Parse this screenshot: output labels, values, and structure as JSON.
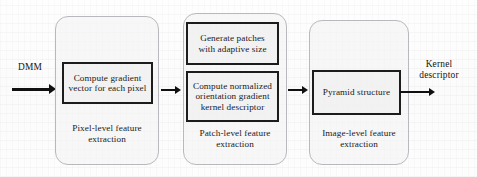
{
  "figure": {
    "type": "flow-diagram",
    "orientation": "left-to-right",
    "background_note": "scanned paper with faint bleed-through texture"
  },
  "input": {
    "label": "DMM"
  },
  "output": {
    "label_line1": "Kernel",
    "label_line2": "descriptor"
  },
  "stages": [
    {
      "id": "pixel-level",
      "caption_line1": "Pixel-level feature",
      "caption_line2": "extraction",
      "boxes": [
        {
          "id": "compute-gradient",
          "line1": "Compute gradient",
          "line2": "vector for each pixel"
        }
      ]
    },
    {
      "id": "patch-level",
      "caption_line1": "Patch-level feature",
      "caption_line2": "extraction",
      "boxes": [
        {
          "id": "generate-patches",
          "line1": "Generate patches",
          "line2": "with adaptive size"
        },
        {
          "id": "compute-kernel-descriptor",
          "line1": "Compute normalized",
          "line2": "orientation gradient",
          "line3": "kernel descriptor"
        }
      ]
    },
    {
      "id": "image-level",
      "caption_line1": "Image-level feature",
      "caption_line2": "extraction",
      "boxes": [
        {
          "id": "pyramid-structure",
          "line1": "Pyramid structure"
        }
      ]
    }
  ],
  "colors": {
    "box_border": "#1c1c1c",
    "group_border": "#b9b9bd",
    "arrow": "#101010",
    "text": "#1a1a1a",
    "page": "#fdfdfd"
  }
}
